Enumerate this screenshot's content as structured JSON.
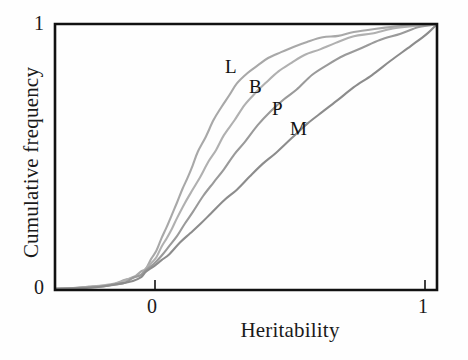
{
  "figure": {
    "background": "#fefefe",
    "frame_color": "#111111"
  },
  "axes": {
    "xlabel": "Heritability",
    "ylabel": "Cumulative frequency",
    "x_ticks": [
      "0",
      "1"
    ],
    "y_ticks": [
      "0",
      "1"
    ]
  },
  "labels": {
    "L": "L",
    "B": "B",
    "P": "P",
    "M": "M"
  },
  "chart_data": {
    "type": "line",
    "title": "",
    "subtitle": "",
    "xlabel": "Heritability",
    "ylabel": "Cumulative frequency",
    "xlim": [
      -0.35,
      1.12
    ],
    "ylim": [
      0,
      1
    ],
    "x_ticks": [
      0,
      1
    ],
    "y_ticks": [
      0,
      1
    ],
    "grid": false,
    "legend": "inline-curve-labels",
    "annotations": [
      {
        "text": "L",
        "x": 0.27,
        "y": 0.88
      },
      {
        "text": "B",
        "x": 0.36,
        "y": 0.8
      },
      {
        "text": "P",
        "x": 0.44,
        "y": 0.72
      },
      {
        "text": "M",
        "x": 0.51,
        "y": 0.65
      }
    ],
    "colors": {
      "L": "#a8a8a8",
      "B": "#b0b0b0",
      "P": "#9a9a9a",
      "M": "#8c8c8c"
    },
    "series": [
      {
        "name": "L",
        "color": "#a8a8a8",
        "x": [
          -0.35,
          -0.28,
          -0.22,
          -0.16,
          -0.12,
          -0.08,
          -0.05,
          -0.02,
          0.0,
          0.02,
          0.04,
          0.06,
          0.08,
          0.1,
          0.12,
          0.14,
          0.16,
          0.18,
          0.2,
          0.23,
          0.26,
          0.29,
          0.32,
          0.35,
          0.39,
          0.43,
          0.47,
          0.52,
          0.57,
          0.62,
          0.68,
          0.74,
          0.8,
          0.88,
          0.96,
          1.05,
          1.12
        ],
        "y": [
          0.005,
          0.008,
          0.012,
          0.018,
          0.025,
          0.035,
          0.048,
          0.065,
          0.085,
          0.115,
          0.15,
          0.19,
          0.235,
          0.285,
          0.33,
          0.375,
          0.42,
          0.47,
          0.52,
          0.575,
          0.635,
          0.69,
          0.735,
          0.775,
          0.815,
          0.845,
          0.87,
          0.895,
          0.915,
          0.932,
          0.948,
          0.96,
          0.972,
          0.982,
          0.99,
          0.997,
          1.0
        ]
      },
      {
        "name": "B",
        "color": "#b0b0b0",
        "x": [
          -0.35,
          -0.28,
          -0.22,
          -0.16,
          -0.12,
          -0.08,
          -0.05,
          -0.02,
          0.0,
          0.02,
          0.04,
          0.06,
          0.08,
          0.1,
          0.12,
          0.15,
          0.18,
          0.21,
          0.24,
          0.27,
          0.3,
          0.34,
          0.38,
          0.42,
          0.46,
          0.51,
          0.56,
          0.61,
          0.67,
          0.73,
          0.8,
          0.87,
          0.95,
          1.03,
          1.12
        ],
        "y": [
          0.004,
          0.007,
          0.011,
          0.016,
          0.022,
          0.032,
          0.044,
          0.06,
          0.078,
          0.1,
          0.128,
          0.16,
          0.195,
          0.235,
          0.275,
          0.325,
          0.378,
          0.43,
          0.48,
          0.53,
          0.58,
          0.64,
          0.695,
          0.742,
          0.782,
          0.822,
          0.855,
          0.882,
          0.908,
          0.93,
          0.95,
          0.966,
          0.98,
          0.992,
          1.0
        ]
      },
      {
        "name": "P",
        "color": "#9a9a9a",
        "x": [
          -0.35,
          -0.28,
          -0.22,
          -0.16,
          -0.12,
          -0.08,
          -0.05,
          -0.02,
          0.0,
          0.03,
          0.06,
          0.09,
          0.12,
          0.15,
          0.18,
          0.22,
          0.26,
          0.3,
          0.34,
          0.38,
          0.43,
          0.48,
          0.53,
          0.58,
          0.64,
          0.7,
          0.76,
          0.83,
          0.9,
          0.98,
          1.05,
          1.12
        ],
        "y": [
          0.004,
          0.006,
          0.01,
          0.015,
          0.021,
          0.03,
          0.042,
          0.056,
          0.072,
          0.098,
          0.132,
          0.168,
          0.208,
          0.25,
          0.295,
          0.35,
          0.405,
          0.458,
          0.508,
          0.558,
          0.615,
          0.668,
          0.715,
          0.758,
          0.805,
          0.845,
          0.878,
          0.912,
          0.94,
          0.968,
          0.988,
          1.0
        ]
      },
      {
        "name": "M",
        "color": "#8c8c8c",
        "x": [
          -0.35,
          -0.28,
          -0.22,
          -0.16,
          -0.12,
          -0.08,
          -0.05,
          -0.02,
          0.0,
          0.03,
          0.06,
          0.09,
          0.13,
          0.17,
          0.21,
          0.25,
          0.3,
          0.35,
          0.4,
          0.45,
          0.5,
          0.56,
          0.62,
          0.68,
          0.74,
          0.8,
          0.87,
          0.94,
          1.02,
          1.08,
          1.12
        ],
        "y": [
          0.004,
          0.006,
          0.009,
          0.014,
          0.019,
          0.027,
          0.037,
          0.05,
          0.064,
          0.085,
          0.11,
          0.138,
          0.175,
          0.212,
          0.25,
          0.288,
          0.335,
          0.382,
          0.428,
          0.472,
          0.518,
          0.57,
          0.62,
          0.668,
          0.715,
          0.76,
          0.812,
          0.862,
          0.918,
          0.965,
          1.0
        ]
      }
    ]
  }
}
